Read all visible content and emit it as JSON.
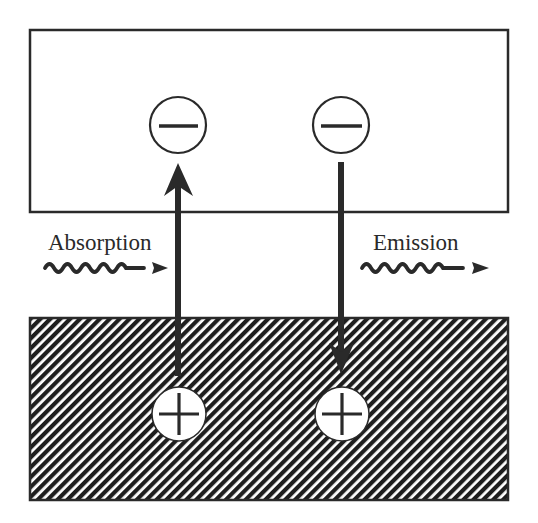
{
  "diagram": {
    "title": "",
    "colors": {
      "stroke": "#2a2a2a",
      "background": "#ffffff",
      "hatch": "#1e1e1e"
    },
    "upper_band": {
      "name": "conduction-band",
      "fill": "empty"
    },
    "lower_band": {
      "name": "valence-band",
      "fill": "hatched"
    },
    "processes": [
      {
        "name": "absorption",
        "label": "Absorption",
        "photon": "incoming wavy arrow",
        "transition": "upward arrow from + (lower band) to − (upper band)"
      },
      {
        "name": "emission",
        "label": "Emission",
        "photon": "outgoing wavy arrow",
        "transition": "downward arrow from − (upper band) to + (lower band)"
      }
    ],
    "charges": {
      "electron_symbol": "−",
      "hole_symbol": "+"
    }
  }
}
